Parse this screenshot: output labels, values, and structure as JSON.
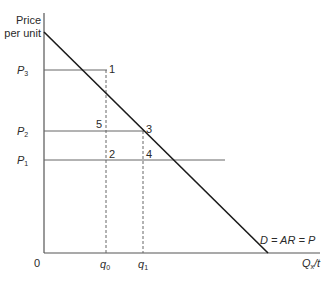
{
  "diagram": {
    "y_axis_label_line1": "Price",
    "y_axis_label_line2": "per unit",
    "origin_label": "0",
    "x_axis_label": {
      "main": "Q",
      "sub": "x",
      "suffix": "/t"
    },
    "price_levels": [
      {
        "main": "P",
        "sub": "3"
      },
      {
        "main": "P",
        "sub": "2"
      },
      {
        "main": "P",
        "sub": "1"
      }
    ],
    "quantity_levels": [
      {
        "main": "q",
        "sub": "0"
      },
      {
        "main": "q",
        "sub": "1"
      }
    ],
    "points": [
      "1",
      "5",
      "3",
      "2",
      "4"
    ],
    "curve_label": "D = AR = P",
    "colors": {
      "axis": "#555555",
      "demand": "#1a1a1a",
      "price_line": "#666666",
      "dashed": "#666666"
    }
  }
}
